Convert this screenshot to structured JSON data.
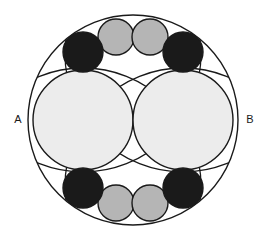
{
  "figure": {
    "background_color": "#ffffff",
    "stroke_color": "#1a1a1a",
    "stroke_width": 1.4,
    "colors": {
      "outer_fill": "#ffffff",
      "large_fill": "#ececec",
      "gray_small_fill": "#b5b5b5",
      "dark_small_fill": "#1a1a1a",
      "arc_stroke": "#1a1a1a",
      "label_color": "#1a1a1a"
    },
    "labels": [
      {
        "id": "label-a",
        "text": "A",
        "x": 18,
        "y": 120,
        "anchor": "middle"
      },
      {
        "id": "label-b",
        "text": "B",
        "x": 250,
        "y": 120,
        "anchor": "middle"
      }
    ],
    "outer_circle": {
      "id": "outer-circle",
      "cx": 133,
      "cy": 120,
      "r": 105,
      "fill": "#ffffff"
    },
    "large_circles": [
      {
        "id": "large-circle-left",
        "cx": 83,
        "cy": 120,
        "r": 50,
        "fill": "#ececec"
      },
      {
        "id": "large-circle-right",
        "cx": 183,
        "cy": 120,
        "r": 50,
        "fill": "#ececec"
      }
    ],
    "dark_circles": [
      {
        "id": "dark-circle-top-left",
        "cx": 83,
        "cy": 52,
        "r": 20,
        "fill": "#1a1a1a"
      },
      {
        "id": "dark-circle-top-right",
        "cx": 183,
        "cy": 52,
        "r": 20,
        "fill": "#1a1a1a"
      },
      {
        "id": "dark-circle-bottom-left",
        "cx": 83,
        "cy": 188,
        "r": 20,
        "fill": "#1a1a1a"
      },
      {
        "id": "dark-circle-bottom-right",
        "cx": 183,
        "cy": 188,
        "r": 20,
        "fill": "#1a1a1a"
      }
    ],
    "gray_circles": [
      {
        "id": "gray-circle-top-left",
        "cx": 116,
        "cy": 37,
        "r": 18,
        "fill": "#b5b5b5"
      },
      {
        "id": "gray-circle-top-right",
        "cx": 150,
        "cy": 37,
        "r": 18,
        "fill": "#b5b5b5"
      },
      {
        "id": "gray-circle-bottom-left",
        "cx": 116,
        "cy": 203,
        "r": 18,
        "fill": "#b5b5b5"
      },
      {
        "id": "gray-circle-bottom-right",
        "cx": 150,
        "cy": 203,
        "r": 18,
        "fill": "#b5b5b5"
      }
    ],
    "construction_arcs": [
      {
        "id": "arc-upper-left",
        "cx": 83,
        "cy": 186,
        "r": 118,
        "dash": "none"
      },
      {
        "id": "arc-upper-right",
        "cx": 183,
        "cy": 186,
        "r": 118,
        "dash": "none"
      },
      {
        "id": "arc-lower-left",
        "cx": 83,
        "cy": 54,
        "r": 118,
        "dash": "none"
      },
      {
        "id": "arc-lower-right",
        "cx": 183,
        "cy": 54,
        "r": 118,
        "dash": "none"
      }
    ],
    "counts": {
      "outer": 1,
      "large": 2,
      "dark_small": 4,
      "gray_small": 4,
      "arcs": 4
    }
  }
}
